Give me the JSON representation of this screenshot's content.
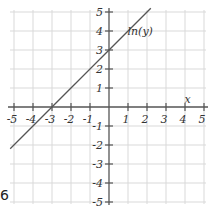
{
  "chart_data": {
    "type": "line",
    "title": "",
    "xlabel": "x",
    "ylabel": "ln(y)",
    "xlim": [
      -5,
      5
    ],
    "ylim": [
      -5,
      5
    ],
    "grid": true,
    "x_ticks": [
      -5,
      -4,
      -3,
      -2,
      -1,
      1,
      2,
      3,
      4,
      5
    ],
    "y_ticks": [
      5,
      4,
      3,
      2,
      1,
      -1,
      -2,
      -3,
      -4,
      -5
    ],
    "x_tick_labels": [
      "-5",
      "-4",
      "-3",
      "-2",
      "-1",
      "1",
      "2",
      "3",
      "4",
      "5"
    ],
    "y_tick_labels": [
      "5",
      "4",
      "3",
      "2",
      "1",
      "-1",
      "-2",
      "-3",
      "-4",
      "-5"
    ],
    "series": [
      {
        "name": "ln(y)",
        "equation": "ln(y) = x + 3",
        "slope": 1,
        "intercept": 3,
        "x": [
          -5.2,
          2.2
        ],
        "y": [
          -2.2,
          5.2
        ]
      }
    ],
    "annotations": [
      {
        "text": "ln(y)",
        "x": 1.5,
        "y": 4
      },
      {
        "text": "x",
        "x": 4.5,
        "y": 0.4
      }
    ]
  },
  "corner_text": "6"
}
